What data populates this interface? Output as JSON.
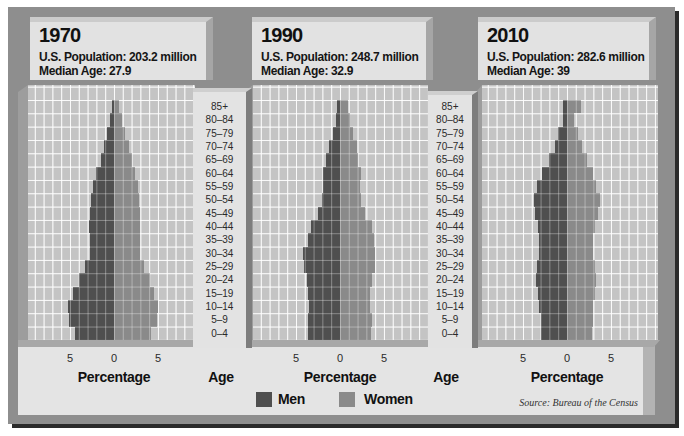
{
  "legend": {
    "men_label": "Men",
    "women_label": "Women",
    "men_color": "#4f4f4f",
    "women_color": "#8a8a8a"
  },
  "source": "Source: Bureau of the Census",
  "colors": {
    "frame": "#8e8e8e",
    "plot_background": "#c4c4c4",
    "gridline": "#ffffff",
    "panel": "#e2e2e2"
  },
  "chart_data": [
    {
      "type": "bar",
      "subtype": "population-pyramid",
      "title": "1970",
      "subtitle": [
        "U.S. Population: 203.2 million",
        "Median Age: 27.9"
      ],
      "categories": [
        "85+",
        "80–84",
        "75–79",
        "70–74",
        "65–69",
        "60–64",
        "55–59",
        "50–54",
        "45–49",
        "40–44",
        "35–39",
        "30–34",
        "25–29",
        "20–24",
        "15–19",
        "10–14",
        "5–9",
        "0–4"
      ],
      "series": [
        {
          "name": "Men",
          "color": "#4f4f4f",
          "values": [
            0.2,
            0.4,
            0.8,
            1.1,
            1.5,
            2.0,
            2.4,
            2.6,
            2.7,
            2.8,
            2.7,
            2.7,
            3.3,
            4.0,
            4.7,
            5.2,
            5.1,
            4.4
          ]
        },
        {
          "name": "Women",
          "color": "#8a8a8a",
          "values": [
            0.6,
            0.9,
            1.3,
            1.7,
            2.0,
            2.4,
            2.7,
            2.8,
            2.9,
            3.0,
            2.9,
            2.9,
            3.4,
            4.1,
            4.6,
            5.0,
            4.9,
            4.2
          ]
        }
      ],
      "xlabel": "Percentage",
      "ylabel": "Age",
      "xticks": [
        -5,
        0,
        5
      ],
      "xtick_labels": [
        "5",
        "0",
        "5"
      ],
      "xlim": [
        -10,
        9
      ],
      "grid": true,
      "legend_position": "bottom"
    },
    {
      "type": "bar",
      "subtype": "population-pyramid",
      "title": "1990",
      "subtitle": [
        "U.S. Population: 248.7 million",
        "Median Age: 32.9"
      ],
      "categories": [
        "85+",
        "80–84",
        "75–79",
        "70–74",
        "65–69",
        "60–64",
        "55–59",
        "50–54",
        "45–49",
        "40–44",
        "35–39",
        "30–34",
        "25–29",
        "20–24",
        "15–19",
        "10–14",
        "5–9",
        "0–4"
      ],
      "series": [
        {
          "name": "Men",
          "color": "#4f4f4f",
          "values": [
            0.3,
            0.4,
            0.8,
            1.2,
            1.6,
            1.9,
            1.9,
            2.0,
            2.5,
            3.3,
            3.6,
            4.2,
            4.1,
            3.8,
            3.6,
            3.5,
            3.6,
            3.6
          ]
        },
        {
          "name": "Women",
          "color": "#8a8a8a",
          "values": [
            0.9,
            1.1,
            1.5,
            1.9,
            2.1,
            2.4,
            2.3,
            2.4,
            2.8,
            3.6,
            3.9,
            4.0,
            4.0,
            3.6,
            3.4,
            3.4,
            3.6,
            3.5
          ]
        }
      ],
      "xlabel": "Percentage",
      "ylabel": "Age",
      "xticks": [
        -5,
        0,
        5
      ],
      "xtick_labels": [
        "5",
        "0",
        "5"
      ],
      "xlim": [
        -10,
        10
      ],
      "grid": true,
      "legend_position": "bottom"
    },
    {
      "type": "bar",
      "subtype": "population-pyramid",
      "title": "2010",
      "subtitle": [
        "U.S. Population: 282.6 million",
        "Median Age: 39"
      ],
      "categories": [
        "85+",
        "80–84",
        "75–79",
        "70–74",
        "65–69",
        "60–64",
        "55–59",
        "50–54",
        "45–49",
        "40–44",
        "35–39",
        "30–34",
        "25–29",
        "20–24",
        "15–19",
        "10–14",
        "5–9",
        "0–4"
      ],
      "series": [
        {
          "name": "Men",
          "color": "#4f4f4f",
          "values": [
            0.5,
            0.5,
            1.0,
            1.4,
            2.0,
            2.8,
            3.4,
            3.7,
            3.6,
            3.3,
            3.2,
            3.2,
            3.4,
            3.5,
            3.3,
            3.2,
            2.9,
            2.9
          ]
        },
        {
          "name": "Women",
          "color": "#8a8a8a",
          "values": [
            1.6,
            0.8,
            1.2,
            1.7,
            2.3,
            2.9,
            3.3,
            3.8,
            3.5,
            3.2,
            3.0,
            3.0,
            3.2,
            3.3,
            3.2,
            3.0,
            2.9,
            2.8
          ]
        }
      ],
      "xlabel": "Percentage",
      "ylabel": "",
      "xticks": [
        -5,
        0,
        5
      ],
      "xtick_labels": [
        "5",
        "0",
        "5"
      ],
      "xlim": [
        -10,
        10
      ],
      "grid": true,
      "legend_position": "bottom"
    }
  ]
}
